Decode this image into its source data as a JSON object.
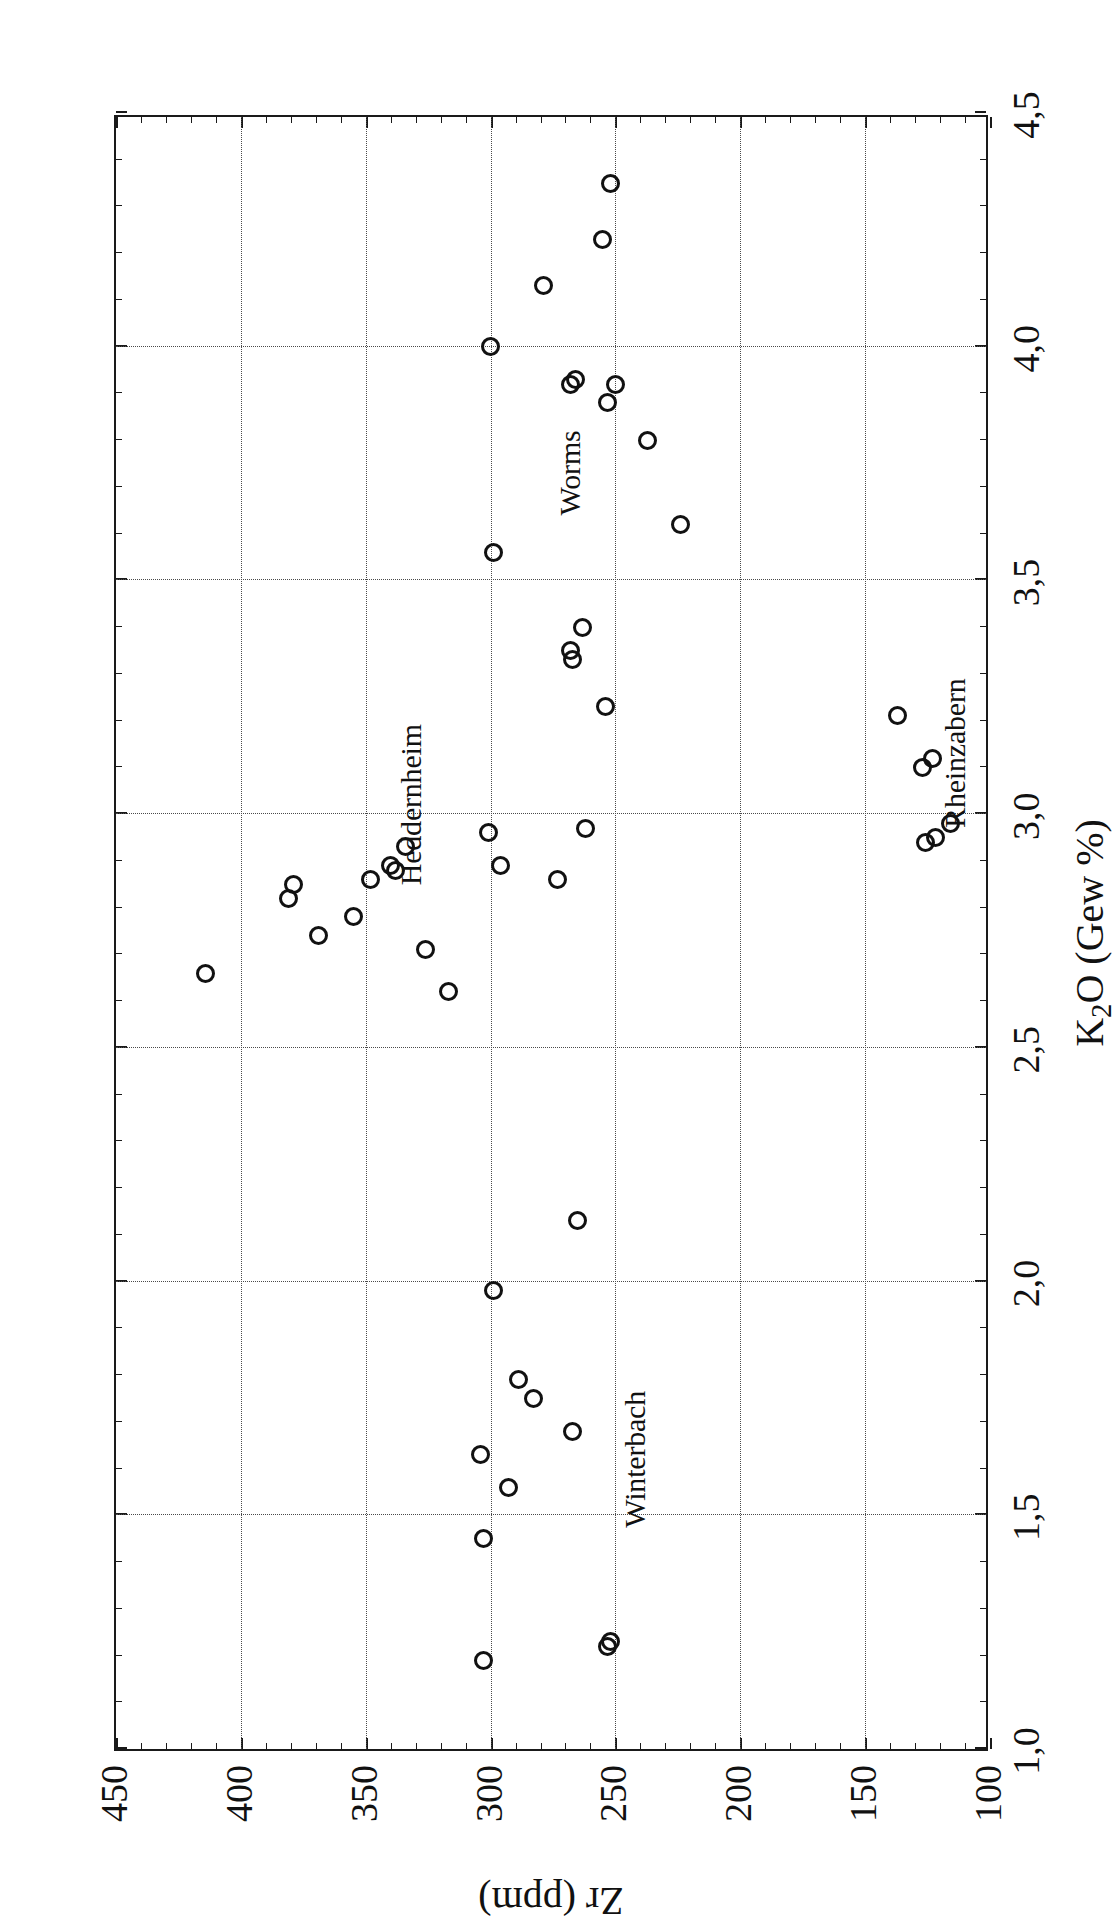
{
  "chart_data": {
    "type": "scatter",
    "title": "",
    "xlabel": "K2O (Gew %)",
    "xlabel_parts": {
      "lead": "K",
      "sub": "2",
      "tail": "O (Gew %)"
    },
    "ylabel": "Zr (ppm)",
    "xlim": [
      1.0,
      4.5
    ],
    "ylim": [
      100,
      450
    ],
    "xticks": [
      1.0,
      1.5,
      2.0,
      2.5,
      3.0,
      3.5,
      4.0,
      4.5
    ],
    "xtick_labels": [
      "1,0",
      "1,5",
      "2,0",
      "2,5",
      "3,0",
      "3,5",
      "4,0",
      "4,5"
    ],
    "yticks": [
      100,
      150,
      200,
      250,
      300,
      350,
      400,
      450
    ],
    "ytick_labels": [
      "100",
      "150",
      "200",
      "250",
      "300",
      "350",
      "400",
      "450"
    ],
    "xtick_minor_step": 0.1,
    "ytick_minor_step": 10,
    "grid": true,
    "grid_style": "dotted",
    "marker": "open-circle",
    "marker_color": "#111111",
    "legend_position": "inline-annotations",
    "annotations": [
      {
        "text": "Winterbach",
        "x": 1.62,
        "y": 242
      },
      {
        "text": "Heddernheim",
        "x": 3.02,
        "y": 332
      },
      {
        "text": "Worms",
        "x": 3.73,
        "y": 268
      },
      {
        "text": "Rheinzabern",
        "x": 3.13,
        "y": 114
      }
    ],
    "series": [
      {
        "name": "Winterbach",
        "points": [
          {
            "x": 1.19,
            "y": 303
          },
          {
            "x": 1.22,
            "y": 253
          },
          {
            "x": 1.23,
            "y": 252
          },
          {
            "x": 1.45,
            "y": 303
          },
          {
            "x": 1.56,
            "y": 293
          },
          {
            "x": 1.63,
            "y": 304
          },
          {
            "x": 1.68,
            "y": 267
          },
          {
            "x": 1.75,
            "y": 283
          },
          {
            "x": 1.79,
            "y": 289
          },
          {
            "x": 1.98,
            "y": 299
          },
          {
            "x": 2.13,
            "y": 265
          }
        ]
      },
      {
        "name": "Heddernheim",
        "points": [
          {
            "x": 2.66,
            "y": 414
          },
          {
            "x": 2.62,
            "y": 317
          },
          {
            "x": 2.71,
            "y": 326
          },
          {
            "x": 2.74,
            "y": 369
          },
          {
            "x": 2.78,
            "y": 355
          },
          {
            "x": 2.82,
            "y": 381
          },
          {
            "x": 2.85,
            "y": 379
          },
          {
            "x": 2.86,
            "y": 348
          },
          {
            "x": 2.86,
            "y": 273
          },
          {
            "x": 2.88,
            "y": 338
          },
          {
            "x": 2.89,
            "y": 296
          },
          {
            "x": 2.89,
            "y": 340
          },
          {
            "x": 2.93,
            "y": 334
          },
          {
            "x": 2.96,
            "y": 301
          },
          {
            "x": 2.97,
            "y": 262
          }
        ]
      },
      {
        "name": "Worms",
        "points": [
          {
            "x": 3.23,
            "y": 254
          },
          {
            "x": 3.33,
            "y": 267
          },
          {
            "x": 3.35,
            "y": 268
          },
          {
            "x": 3.4,
            "y": 263
          },
          {
            "x": 3.56,
            "y": 299
          },
          {
            "x": 3.62,
            "y": 224
          },
          {
            "x": 3.8,
            "y": 237
          },
          {
            "x": 3.88,
            "y": 253
          },
          {
            "x": 3.92,
            "y": 268
          },
          {
            "x": 3.93,
            "y": 266
          },
          {
            "x": 3.92,
            "y": 250
          },
          {
            "x": 4.0,
            "y": 300
          },
          {
            "x": 4.13,
            "y": 279
          },
          {
            "x": 4.23,
            "y": 255
          },
          {
            "x": 4.35,
            "y": 252
          }
        ]
      },
      {
        "name": "Rheinzabern",
        "points": [
          {
            "x": 2.94,
            "y": 126
          },
          {
            "x": 2.95,
            "y": 122
          },
          {
            "x": 2.98,
            "y": 116
          },
          {
            "x": 3.1,
            "y": 127
          },
          {
            "x": 3.12,
            "y": 123
          },
          {
            "x": 3.21,
            "y": 137
          }
        ]
      }
    ]
  },
  "figure": {
    "orientation": "rotated-90-ccw",
    "background_color": "#ffffff",
    "frame_color": "#1a1a1a"
  }
}
